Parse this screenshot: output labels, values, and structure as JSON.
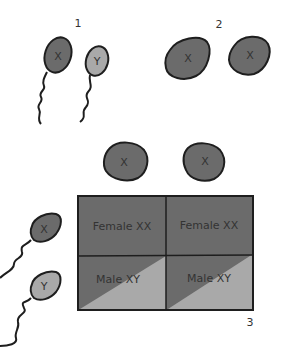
{
  "diagram": {
    "colors": {
      "dark_fill": "#6b6b6b",
      "light_fill": "#a9a9a9",
      "outline": "#1e1e1e",
      "text": "#333333",
      "background": "#ffffff"
    },
    "panels": [
      {
        "number": "1",
        "description": "Sperm cells",
        "items": [
          {
            "type": "sperm",
            "chromosome": "X",
            "shade": "dark"
          },
          {
            "type": "sperm",
            "chromosome": "Y",
            "shade": "light"
          }
        ]
      },
      {
        "number": "2",
        "description": "Egg cells",
        "items": [
          {
            "type": "egg",
            "chromosome": "X",
            "shade": "dark"
          },
          {
            "type": "egg",
            "chromosome": "X",
            "shade": "dark"
          }
        ]
      },
      {
        "number": "3",
        "description": "Punnett square",
        "column_headers": [
          {
            "type": "egg",
            "chromosome": "X"
          },
          {
            "type": "egg",
            "chromosome": "X"
          }
        ],
        "row_headers": [
          {
            "type": "sperm",
            "chromosome": "X"
          },
          {
            "type": "sperm",
            "chromosome": "Y"
          }
        ],
        "cells": [
          [
            "Female XX",
            "Female XX"
          ],
          [
            "Male XY",
            "Male XY"
          ]
        ]
      }
    ]
  }
}
